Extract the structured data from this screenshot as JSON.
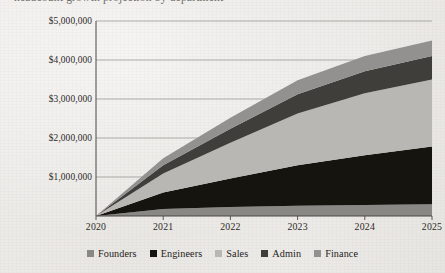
{
  "clipped_heading": "headcount growth projection by department",
  "chart_data": {
    "type": "area",
    "stacked": true,
    "title": "",
    "xlabel": "",
    "ylabel": "",
    "categories": [
      "2020",
      "2021",
      "2022",
      "2023",
      "2024",
      "2025"
    ],
    "x_tick_labels": [
      "2020",
      "2021",
      "2022",
      "2023",
      "2024",
      "2025"
    ],
    "y_tick_labels": [
      "$1,000,000",
      "$2,000,000",
      "$3,000,000",
      "$4,000,000",
      "$5,000,000"
    ],
    "y_tick_values": [
      1000000,
      2000000,
      3000000,
      4000000,
      5000000
    ],
    "ylim": [
      0,
      5000000
    ],
    "grid": true,
    "grid_axis": "y",
    "legend_position": "bottom",
    "series": [
      {
        "name": "Founders",
        "color": "#8a8884",
        "values": [
          0,
          180000,
          230000,
          260000,
          280000,
          300000
        ]
      },
      {
        "name": "Engineers",
        "color": "#16140f",
        "values": [
          0,
          420000,
          730000,
          1040000,
          1280000,
          1480000
        ]
      },
      {
        "name": "Sales",
        "color": "#b9b7b3",
        "values": [
          0,
          490000,
          920000,
          1330000,
          1590000,
          1720000
        ]
      },
      {
        "name": "Admin",
        "color": "#403e3b",
        "values": [
          0,
          210000,
          360000,
          490000,
          560000,
          600000
        ]
      },
      {
        "name": "Finance",
        "color": "#939190",
        "values": [
          0,
          180000,
          280000,
          360000,
          390000,
          400000
        ]
      }
    ],
    "totals": [
      0,
      1480000,
      2520000,
      3480000,
      4100000,
      4500000
    ]
  }
}
